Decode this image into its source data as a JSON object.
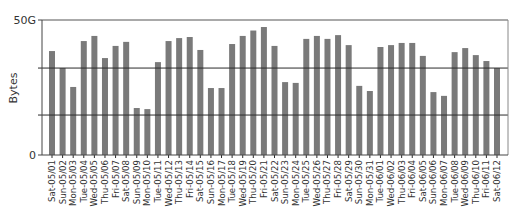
{
  "chart_data": {
    "type": "bar",
    "title": "",
    "xlabel": "",
    "ylabel": "Bytes",
    "ylim": [
      0,
      50
    ],
    "y_unit": "G",
    "y_tick_labels": [
      {
        "value": 0,
        "label": "0"
      },
      {
        "value": 50,
        "label": "50G"
      }
    ],
    "reference_lines": [
      32.2,
      14.8
    ],
    "grid": false,
    "legend": null,
    "bar_color": "#7a7a7a",
    "line_color": "#2b2b2b",
    "categories": [
      "Sat-05/01",
      "Sun-05/02",
      "Mon-05/03",
      "Tue-05/04",
      "Wed-05/05",
      "Thu-05/06",
      "Fri-05/07",
      "Sat-05/08",
      "Sun-05/09",
      "Mon-05/10",
      "Tue-05/11",
      "Wed-05/12",
      "Thu-05/13",
      "Fri-05/14",
      "Sat-05/15",
      "Sun-05/16",
      "Mon-05/17",
      "Tue-05/18",
      "Wed-05/19",
      "Thu-05/20",
      "Fri-05/21",
      "Sat-05/22",
      "Sun-05/23",
      "Mon-05/24",
      "Tue-05/25",
      "Wed-05/26",
      "Thu-05/27",
      "Fri-05/28",
      "Sat-05/29",
      "Sun-05/30",
      "Mon-05/31",
      "Tue-06/01",
      "Wed-06/02",
      "Thu-06/03",
      "Fri-06/04",
      "Sat-06/05",
      "Sun-06/06",
      "Mon-06/07",
      "Tue-06/08",
      "Wed-06/09",
      "Thu-06/10",
      "Fri-06/11",
      "Sat-06/12"
    ],
    "values": [
      38.5,
      32.2,
      25.2,
      42.2,
      44.1,
      35.9,
      40.4,
      41.9,
      17.4,
      17.0,
      34.4,
      42.2,
      43.3,
      43.7,
      38.9,
      24.8,
      24.8,
      41.1,
      44.1,
      46.1,
      47.4,
      40.4,
      27.0,
      26.7,
      43.0,
      44.1,
      43.0,
      44.4,
      40.7,
      25.6,
      23.7,
      40.0,
      40.7,
      41.5,
      41.5,
      36.7,
      23.3,
      21.9,
      38.1,
      39.6,
      37.0,
      34.8,
      32.2
    ]
  }
}
